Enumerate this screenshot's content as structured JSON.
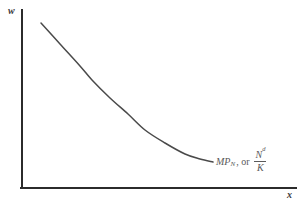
{
  "chart_data": {
    "type": "line",
    "title": "",
    "xlabel": "x",
    "ylabel": "w",
    "grid": false,
    "legend": "none",
    "axis_color": "#2b2b2b",
    "curve_color": "#4a4a4a",
    "label_color": "#5a5a5a",
    "background_color": "#ffffff",
    "annotations": [
      {
        "text": "MP_N, or N^d/K",
        "parts": {
          "main": "MP",
          "main_subscript": "N",
          "connector": ", or",
          "fraction_numerator": "N",
          "fraction_numerator_superscript": "d",
          "fraction_denominator": "K"
        },
        "x": 216,
        "y": 150
      }
    ],
    "series": [
      {
        "name": "MP_N",
        "description": "downward-sloping convex marginal product of labor curve",
        "points": [
          {
            "x": 41,
            "y": 23
          },
          {
            "x": 60,
            "y": 44
          },
          {
            "x": 80,
            "y": 66
          },
          {
            "x": 92,
            "y": 80
          },
          {
            "x": 110,
            "y": 98
          },
          {
            "x": 128,
            "y": 114
          },
          {
            "x": 145,
            "y": 130
          },
          {
            "x": 165,
            "y": 143
          },
          {
            "x": 185,
            "y": 154
          },
          {
            "x": 200,
            "y": 159
          },
          {
            "x": 213,
            "y": 162
          }
        ]
      }
    ],
    "axes": {
      "origin": {
        "x": 22,
        "y": 188
      },
      "y_axis_top": {
        "x": 22,
        "y": 10
      },
      "x_axis_right": {
        "x": 296,
        "y": 188
      }
    }
  },
  "axis_labels": {
    "y": "w",
    "x": "x"
  },
  "curve_label": {
    "main": "MP",
    "main_subscript": "N",
    "connector": ", or",
    "fraction_numerator": "N",
    "fraction_numerator_superscript": "d",
    "fraction_denominator": "K"
  }
}
